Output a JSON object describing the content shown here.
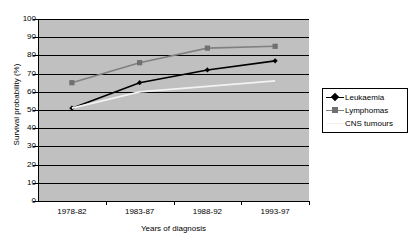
{
  "chart_data": {
    "type": "line",
    "title": "",
    "xlabel": "Years of diagnosis",
    "ylabel": "Survival probability (%)",
    "categories": [
      "1978-82",
      "1983-87",
      "1988-92",
      "1993-97"
    ],
    "ylim": [
      0,
      100
    ],
    "y_ticks": [
      0,
      10,
      20,
      30,
      40,
      50,
      60,
      70,
      80,
      90,
      100
    ],
    "y_tick_labels": [
      "0",
      "10",
      "20",
      "30",
      "40",
      "50",
      "60",
      "70",
      "80",
      "90",
      "100"
    ],
    "grid": true,
    "grid_axis": "y",
    "legend_position": "right",
    "series": [
      {
        "name": "Leukaemia",
        "values": [
          51,
          65,
          72,
          77
        ],
        "color": "#000000",
        "marker": "diamond",
        "marker_color": "#000000"
      },
      {
        "name": "Lymphomas",
        "values": [
          65,
          76,
          84,
          85
        ],
        "color": "#808080",
        "marker": "square",
        "marker_color": "#707070"
      },
      {
        "name": "CNS tumours",
        "values": [
          51,
          60,
          63,
          66
        ],
        "color": "#f2f2f2",
        "marker": "none",
        "marker_color": "#f2f2f2"
      }
    ]
  },
  "legend": {
    "entries": [
      {
        "label": "Leukaemia"
      },
      {
        "label": "Lymphomas"
      },
      {
        "label": "CNS tumours"
      }
    ]
  },
  "colors": {
    "plot_background": "#c0c0c0",
    "page_background": "#ffffff",
    "axis": "#000000",
    "gridline": "#000000",
    "leukaemia": "#000000",
    "lymphomas": "#808080",
    "cns_tumours": "#f2f2f2"
  }
}
